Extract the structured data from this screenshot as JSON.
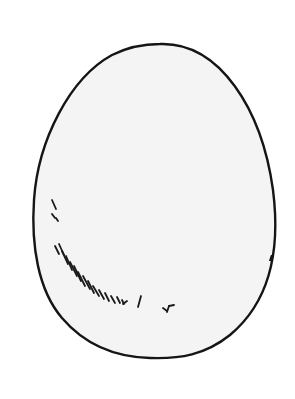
{
  "image": {
    "subject": "egg drawing",
    "colors": {
      "background": "#ffffff",
      "egg_fill": "#f4f4f4",
      "outline": "#151515",
      "hatching": "#1a1a1a"
    }
  }
}
